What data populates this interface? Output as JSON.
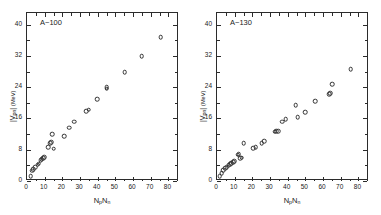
{
  "figure": {
    "background": "#ffffff",
    "marker_color": "#303030",
    "axis_color": "#2b2b2b"
  },
  "chart_data": [
    {
      "type": "scatter",
      "panel_id": "left",
      "title": "",
      "annotation": "A~100",
      "annotation_parts": {
        "prefix": "A",
        "tilde": "~",
        "value": "100"
      },
      "xlabel": "NpNn",
      "xlabel_parts": {
        "n1": "N",
        "sub1": "p",
        "n2": "N",
        "sub2": "n"
      },
      "ylabel": "|Vpn| (MeV)",
      "ylabel_parts": {
        "bar_open": "|",
        "v": "V",
        "sub": "pn",
        "bar_close": "|",
        "unit": "(MeV)"
      },
      "xlim": [
        0,
        86
      ],
      "ylim": [
        0,
        43
      ],
      "xticks": [
        10,
        20,
        30,
        40,
        50,
        60,
        70,
        80
      ],
      "xtick_labels": [
        "10",
        "20",
        "30",
        "40",
        "50",
        "60",
        "70",
        "80"
      ],
      "x_minor_ticks": [
        5,
        15,
        25,
        35,
        45,
        55,
        65,
        75,
        85
      ],
      "yticks": [
        0,
        8,
        16,
        24,
        32,
        40
      ],
      "ytick_labels": [
        "0",
        "8",
        "16",
        "24",
        "32",
        "40"
      ],
      "y_minor_ticks": [
        4,
        12,
        20,
        28,
        36
      ],
      "grid": false,
      "legend": "none",
      "marker": "open-circle",
      "points": [
        [
          2.0,
          1.3
        ],
        [
          3.0,
          2.6
        ],
        [
          3.6,
          3.0
        ],
        [
          4.6,
          3.5
        ],
        [
          6.0,
          4.2
        ],
        [
          6.6,
          4.4
        ],
        [
          7.8,
          5.3
        ],
        [
          8.4,
          5.6
        ],
        [
          9.0,
          5.9
        ],
        [
          9.6,
          6.1
        ],
        [
          12.0,
          8.6
        ],
        [
          13.0,
          9.6
        ],
        [
          13.6,
          9.9
        ],
        [
          14.4,
          12.0
        ],
        [
          15.0,
          8.3
        ],
        [
          21.0,
          11.4
        ],
        [
          23.8,
          13.6
        ],
        [
          26.6,
          15.2
        ],
        [
          33.6,
          17.8
        ],
        [
          35.0,
          18.3
        ],
        [
          39.8,
          21.0
        ],
        [
          45.0,
          23.6
        ],
        [
          45.2,
          24.0
        ],
        [
          55.2,
          27.8
        ],
        [
          65.0,
          32.0
        ],
        [
          75.6,
          36.8
        ]
      ]
    },
    {
      "type": "scatter",
      "panel_id": "right",
      "title": "",
      "annotation": "A~130",
      "annotation_parts": {
        "prefix": "A",
        "tilde": "~",
        "value": "130"
      },
      "xlabel": "NpNn",
      "xlabel_parts": {
        "n1": "N",
        "sub1": "p",
        "n2": "N",
        "sub2": "n"
      },
      "ylabel": "|Vpn| (MeV)",
      "ylabel_parts": {
        "bar_open": "|",
        "v": "V",
        "sub": "pn",
        "bar_close": "|",
        "unit": "(MeV)"
      },
      "xlim": [
        0,
        86
      ],
      "ylim": [
        0,
        43
      ],
      "xticks": [
        10,
        20,
        30,
        40,
        50,
        60,
        70,
        80
      ],
      "xtick_labels": [
        "10",
        "20",
        "30",
        "40",
        "50",
        "60",
        "70",
        "80"
      ],
      "x_minor_ticks": [
        5,
        15,
        25,
        35,
        45,
        55,
        65,
        75,
        85
      ],
      "yticks": [
        0,
        8,
        16,
        24,
        32,
        40
      ],
      "ytick_labels": [
        "0",
        "8",
        "16",
        "24",
        "32",
        "40"
      ],
      "y_minor_ticks": [
        4,
        12,
        20,
        28,
        36
      ],
      "grid": false,
      "legend": "none",
      "marker": "open-circle",
      "points": [
        [
          1.6,
          1.2
        ],
        [
          2.6,
          2.0
        ],
        [
          3.6,
          2.7
        ],
        [
          4.6,
          3.2
        ],
        [
          5.6,
          3.6
        ],
        [
          6.6,
          4.0
        ],
        [
          7.6,
          4.3
        ],
        [
          8.2,
          4.6
        ],
        [
          9.0,
          4.8
        ],
        [
          9.6,
          5.0
        ],
        [
          11.6,
          6.7
        ],
        [
          12.2,
          6.9
        ],
        [
          13.0,
          5.8
        ],
        [
          14.0,
          6.0
        ],
        [
          15.2,
          9.6
        ],
        [
          20.6,
          8.4
        ],
        [
          22.0,
          8.6
        ],
        [
          25.4,
          9.6
        ],
        [
          26.8,
          10.2
        ],
        [
          32.6,
          12.6
        ],
        [
          33.6,
          12.8
        ],
        [
          34.6,
          12.7
        ],
        [
          38.8,
          15.8
        ],
        [
          37.0,
          15.2
        ],
        [
          44.6,
          19.4
        ],
        [
          45.6,
          16.3
        ],
        [
          49.8,
          17.6
        ],
        [
          55.4,
          20.4
        ],
        [
          63.6,
          22.2
        ],
        [
          64.0,
          22.4
        ],
        [
          65.2,
          24.8
        ],
        [
          75.6,
          28.6
        ]
      ]
    }
  ]
}
